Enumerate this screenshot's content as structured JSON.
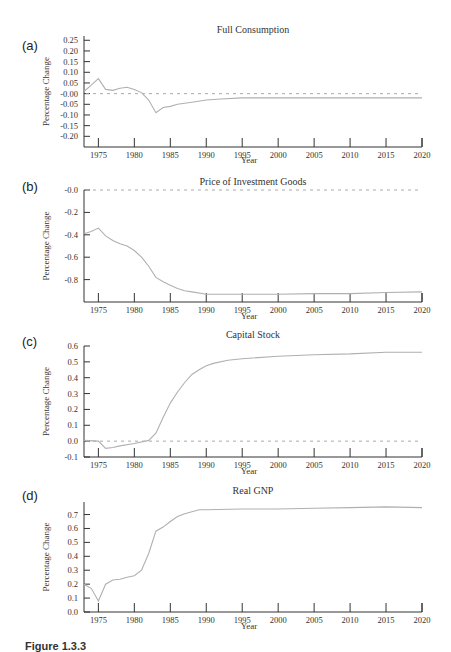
{
  "figure": {
    "caption": "Figure 1.3.3"
  },
  "chart_data": [
    {
      "panel": "(a)",
      "type": "line",
      "title": "Full Consumption",
      "xlabel": "Year",
      "ylabel": "Percentage Change",
      "xlim": [
        1973,
        2020
      ],
      "ylim": [
        -0.25,
        0.25
      ],
      "xticks": [
        1975,
        1980,
        1985,
        1990,
        1995,
        2000,
        2005,
        2010,
        2015,
        2020
      ],
      "yticks": [
        0.25,
        0.2,
        0.15,
        0.1,
        0.05,
        0.0,
        -0.05,
        -0.1,
        -0.15,
        -0.2
      ],
      "ytick_labels": [
        "0.25",
        "0.20",
        "0.15",
        "0.10",
        "0.05",
        "-0.00",
        "-0.05",
        "-0.10",
        "-0.15",
        "-0.20"
      ],
      "reference_line": 0.0,
      "grid": false,
      "x": [
        1973,
        1974,
        1975,
        1976,
        1977,
        1978,
        1979,
        1980,
        1981,
        1982,
        1983,
        1984,
        1985,
        1986,
        1988,
        1990,
        1992,
        1995,
        2000,
        2005,
        2010,
        2015,
        2020
      ],
      "y": [
        0.01,
        0.04,
        0.07,
        0.02,
        0.015,
        0.025,
        0.03,
        0.02,
        0.005,
        -0.03,
        -0.09,
        -0.065,
        -0.06,
        -0.05,
        -0.04,
        -0.03,
        -0.025,
        -0.02,
        -0.02,
        -0.02,
        -0.02,
        -0.02,
        -0.02
      ]
    },
    {
      "panel": "(b)",
      "type": "line",
      "title": "Price of Investment Goods",
      "xlabel": "Year",
      "ylabel": "Percentage Change",
      "xlim": [
        1973,
        2020
      ],
      "ylim": [
        -0.99,
        0.0
      ],
      "xticks": [
        1975,
        1980,
        1985,
        1990,
        1995,
        2000,
        2005,
        2010,
        2015,
        2020
      ],
      "yticks": [
        0.0,
        -0.2,
        -0.4,
        -0.6,
        -0.8
      ],
      "ytick_labels": [
        "-0.0",
        "-0.2",
        "-0.4",
        "-0.6",
        "-0.8"
      ],
      "reference_line": 0.0,
      "grid": false,
      "x": [
        1973,
        1974,
        1975,
        1976,
        1977,
        1978,
        1979,
        1980,
        1981,
        1982,
        1983,
        1984,
        1985,
        1986,
        1987,
        1988,
        1990,
        1995,
        2000,
        2005,
        2010,
        2015,
        2020
      ],
      "y": [
        -0.39,
        -0.37,
        -0.34,
        -0.41,
        -0.45,
        -0.48,
        -0.5,
        -0.54,
        -0.6,
        -0.68,
        -0.78,
        -0.82,
        -0.85,
        -0.88,
        -0.9,
        -0.91,
        -0.93,
        -0.93,
        -0.93,
        -0.925,
        -0.925,
        -0.915,
        -0.91
      ]
    },
    {
      "panel": "(c)",
      "type": "line",
      "title": "Capital Stock",
      "xlabel": "Year",
      "ylabel": "Percentage Change",
      "xlim": [
        1973,
        2020
      ],
      "ylim": [
        -0.1,
        0.61
      ],
      "xticks": [
        1975,
        1980,
        1985,
        1990,
        1995,
        2000,
        2005,
        2010,
        2015,
        2020
      ],
      "yticks": [
        0.6,
        0.5,
        0.4,
        0.3,
        0.2,
        0.1,
        0.0,
        -0.1
      ],
      "ytick_labels": [
        "0.6",
        "0.5",
        "0.4",
        "0.3",
        "0.2",
        "0.1",
        "0.0",
        "-0.1"
      ],
      "reference_line": 0.0,
      "grid": false,
      "x": [
        1973,
        1975,
        1976,
        1977,
        1978,
        1980,
        1982,
        1983,
        1984,
        1985,
        1986,
        1987,
        1988,
        1989,
        1990,
        1991,
        1993,
        1995,
        2000,
        2005,
        2010,
        2015,
        2020
      ],
      "y": [
        0.005,
        0.0,
        -0.045,
        -0.04,
        -0.03,
        -0.015,
        0.005,
        0.05,
        0.15,
        0.24,
        0.31,
        0.37,
        0.42,
        0.45,
        0.475,
        0.49,
        0.51,
        0.52,
        0.535,
        0.545,
        0.55,
        0.56,
        0.56
      ]
    },
    {
      "panel": "(d)",
      "type": "line",
      "title": "Real GNP",
      "xlabel": "Year",
      "ylabel": "Percentage Change",
      "xlim": [
        1973,
        2020
      ],
      "ylim": [
        0.0,
        0.79
      ],
      "xticks": [
        1975,
        1980,
        1985,
        1990,
        1995,
        2000,
        2005,
        2010,
        2015,
        2020
      ],
      "yticks": [
        0.7,
        0.6,
        0.5,
        0.4,
        0.3,
        0.2,
        0.1,
        0.0
      ],
      "ytick_labels": [
        "0.7",
        "0.6",
        "0.5",
        "0.4",
        "0.3",
        "0.2",
        "0.1",
        "0.0"
      ],
      "reference_line": null,
      "grid": false,
      "x": [
        1973,
        1974,
        1975,
        1976,
        1977,
        1978,
        1979,
        1980,
        1981,
        1982,
        1983,
        1984,
        1985,
        1986,
        1987,
        1988,
        1989,
        1990,
        1995,
        2000,
        2005,
        2010,
        2015,
        2020
      ],
      "y": [
        0.2,
        0.17,
        0.08,
        0.2,
        0.23,
        0.235,
        0.25,
        0.26,
        0.3,
        0.42,
        0.58,
        0.61,
        0.65,
        0.685,
        0.705,
        0.72,
        0.735,
        0.735,
        0.74,
        0.74,
        0.745,
        0.75,
        0.755,
        0.75
      ]
    }
  ],
  "layout": {
    "panels": [
      {
        "label_pos": [
          28,
          50
        ],
        "title_y": 33,
        "axis_top": 36,
        "axis_bottom": 147,
        "y_top_val": 0.27,
        "y_bottom_val": -0.25,
        "year_y": 167
      },
      {
        "label_pos": [
          28,
          191
        ],
        "title_y": 185,
        "axis_top": 190,
        "axis_bottom": 302,
        "y_top_val": 0.0,
        "y_bottom_val": -1.0,
        "year_y": 323
      },
      {
        "label_pos": [
          28,
          346
        ],
        "title_y": 338,
        "axis_top": 346,
        "axis_bottom": 457,
        "y_top_val": 0.6,
        "y_bottom_val": -0.1,
        "year_y": 478
      },
      {
        "label_pos": [
          28,
          500
        ],
        "title_y": 494,
        "axis_top": 502,
        "axis_bottom": 612,
        "y_top_val": 0.79,
        "y_bottom_val": 0.0,
        "year_y": 633
      }
    ],
    "x_left": 84,
    "x_right": 422,
    "year_left": 1973,
    "year_right": 2020
  }
}
